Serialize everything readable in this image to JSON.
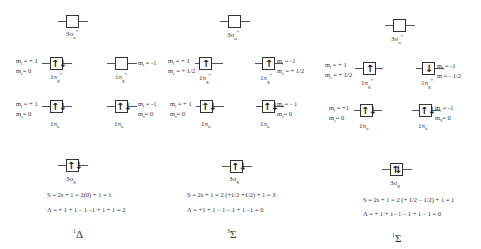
{
  "columns": [
    {
      "id": "col1",
      "orbitals": {
        "sigma_u_star": {
          "label_main": "3σ",
          "label_sub": "u",
          "label_sup": "*",
          "electrons": ""
        },
        "pi_g_left": {
          "label_main": "1π",
          "label_sub": "g",
          "label_sup": "*",
          "electrons": "↑↓",
          "qn_l": "m",
          "qn_l_sub": "l",
          "qn_l_val": " = + 1",
          "qn_s": "m",
          "qn_s_sub": "s",
          "qn_s_val": "= 0"
        },
        "pi_g_right": {
          "label_main": "1π",
          "label_sub": "g",
          "label_sup": "*",
          "electrons": "",
          "qn_l": "m",
          "qn_l_sub": "l",
          "qn_l_val": " = -1",
          "qn_s": "",
          "qn_s_sub": "",
          "qn_s_val": ""
        },
        "pi_u_left": {
          "label_main": "1π",
          "label_sub": "u",
          "label_sup": "",
          "electrons": "↑↓",
          "qn_l": "m",
          "qn_l_sub": "l",
          "qn_l_val": " = + 1",
          "qn_s": "m",
          "qn_s_sub": "s",
          "qn_s_val": "= 0"
        },
        "pi_u_right": {
          "label_main": "1π",
          "label_sub": "u",
          "label_sup": "",
          "electrons": "↑↓",
          "qn_l": "m",
          "qn_l_sub": "l",
          "qn_l_val": " = -1",
          "qn_s": "m",
          "qn_s_sub": "s",
          "qn_s_val": "= 0"
        },
        "sigma_g": {
          "label_main": "3σ",
          "label_sub": "g",
          "label_sup": "",
          "electrons": "↑↓"
        }
      },
      "spin_formula": "S = 2s + 1 = 2(0) + 1 = 1",
      "lambda_formula": "Λ = + 1 + 1 – 1 –1 + 1 + 1 = 2",
      "term_sup": "1",
      "term_symbol": "Δ"
    },
    {
      "id": "col2",
      "orbitals": {
        "sigma_u_star": {
          "label_main": "3σ",
          "label_sub": "u",
          "label_sup": "*",
          "electrons": ""
        },
        "pi_g_left": {
          "label_main": "1π",
          "label_sub": "g",
          "label_sup": "*",
          "electrons": "↑",
          "qn_l": "m",
          "qn_l_sub": "l",
          "qn_l_val": " = + 1",
          "qn_s": "m",
          "qn_s_sub": "s",
          "qn_s_val": " = + 1/2"
        },
        "pi_g_right": {
          "label_main": "1π",
          "label_sub": "g",
          "label_sup": "*",
          "electrons": "↑",
          "qn_l": "m",
          "qn_l_sub": "l",
          "qn_l_val": " = -1",
          "qn_s": "m",
          "qn_s_sub": "s",
          "qn_s_val": " = + 1/2"
        },
        "pi_u_left": {
          "label_main": "1π",
          "label_sub": "u",
          "label_sup": "",
          "electrons": "↑↓",
          "qn_l": "m",
          "qn_l_sub": "l",
          "qn_l_val": " = + 1",
          "qn_s": "m",
          "qn_s_sub": "s",
          "qn_s_val": "= 0"
        },
        "pi_u_right": {
          "label_main": "1π",
          "label_sub": "u",
          "label_sup": "",
          "electrons": "↑↓",
          "qn_l": "m",
          "qn_l_sub": "l",
          "qn_l_val": " = - 1",
          "qn_s": "m",
          "qn_s_sub": "s",
          "qn_s_val": "= 0"
        },
        "sigma_g": {
          "label_main": "3σ",
          "label_sub": "g",
          "label_sup": "",
          "electrons": "↑↓"
        }
      },
      "spin_formula": "S = 2s + 1 = 2 (+1/2 +1/2) + 1 = 3",
      "lambda_formula": "Λ = +1 + 1 – 1 – 1 + 1 –1 = 0",
      "term_sup": "3",
      "term_symbol": "Σ"
    },
    {
      "id": "col3",
      "orbitals": {
        "sigma_u_star": {
          "label_main": "3σ",
          "label_sub": "u",
          "label_sup": "*",
          "electrons": ""
        },
        "pi_g_left": {
          "label_main": "1π",
          "label_sub": "g",
          "label_sup": "*",
          "electrons": "↑",
          "qn_l": "m",
          "qn_l_sub": "l",
          "qn_l_val": " = + 1",
          "qn_s": "m",
          "qn_s_sub": "s",
          "qn_s_val": " = + 1/2"
        },
        "pi_g_right": {
          "label_main": "1π",
          "label_sub": "g",
          "label_sup": "*",
          "electrons": "↓",
          "qn_l": "m",
          "qn_l_sub": "l",
          "qn_l_val": " = -1",
          "qn_s": "m",
          "qn_s_sub": "",
          "qn_s_val": " = - 1/2"
        },
        "pi_u_left": {
          "label_main": "1π",
          "label_sub": "u",
          "label_sup": "",
          "electrons": "↑↓",
          "qn_l": "m",
          "qn_l_sub": "l",
          "qn_l_val": " = +1",
          "qn_s": "m",
          "qn_s_sub": "s",
          "qn_s_val": "= 0"
        },
        "pi_u_right": {
          "label_main": "1π",
          "label_sub": "u",
          "label_sup": "",
          "electrons": "↑↓",
          "qn_l": "m",
          "qn_l_sub": "l",
          "qn_l_val": " = -1",
          "qn_s": "m",
          "qn_s_sub": "S",
          "qn_s_val": "= 0"
        },
        "sigma_g": {
          "label_main": "3σ",
          "label_sub": "g",
          "label_sup": "",
          "electrons": "⇅"
        }
      },
      "spin_formula": "S = 2s + 1 = 2 (+ 1/2 – 1/2) + 1 = 1",
      "lambda_formula": "Λ = + 1 + 1– 1 – 1 + 1 – 1 = 0",
      "term_sup": "1",
      "term_symbol": "Σ"
    }
  ]
}
